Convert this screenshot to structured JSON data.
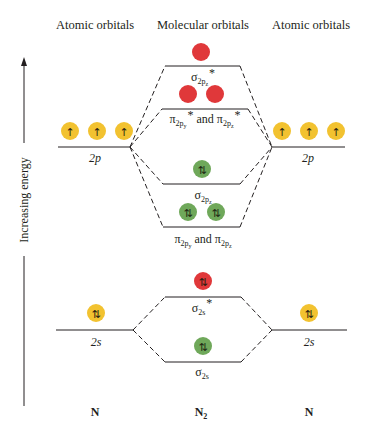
{
  "headers": {
    "left": "Atomic orbitals",
    "center": "Molecular orbitals",
    "right": "Atomic orbitals"
  },
  "axis": {
    "label": "Increasing energy",
    "direction": "up"
  },
  "colors": {
    "atomic_orbital": "#f2c230",
    "bonding": "#6fa85a",
    "antibonding": "#e0383a",
    "line": "#231f20"
  },
  "atoms": {
    "left": {
      "name": "N",
      "levels": [
        {
          "label": "2p",
          "electrons": [
            "↑",
            "↑",
            "↑"
          ]
        },
        {
          "label": "2s",
          "electrons": [
            "⇅"
          ]
        }
      ]
    },
    "right": {
      "name": "N",
      "levels": [
        {
          "label": "2p",
          "electrons": [
            "↑",
            "↑",
            "↑"
          ]
        },
        {
          "label": "2s",
          "electrons": [
            "⇅"
          ]
        }
      ]
    }
  },
  "molecule": {
    "name": "N",
    "name_subscript": "2",
    "orbitals": [
      {
        "id": "sigma2pz_star",
        "symbol": "σ",
        "sub": "2p",
        "subsub": "z",
        "star": "*",
        "type": "antibonding",
        "electrons": [
          ""
        ]
      },
      {
        "id": "pi2p_star",
        "text_a": "π",
        "sub_a": "2p",
        "subsub_a": "y",
        "star_a": "*",
        "conj": " and ",
        "text_b": "π",
        "sub_b": "2p",
        "subsub_b": "z",
        "star_b": "*",
        "type": "antibonding",
        "electrons": [
          "",
          ""
        ]
      },
      {
        "id": "sigma2pz",
        "symbol": "σ",
        "sub": "2p",
        "subsub": "z",
        "type": "bonding",
        "electrons": [
          "⇅"
        ]
      },
      {
        "id": "pi2p",
        "text_a": "π",
        "sub_a": "2p",
        "subsub_a": "y",
        "conj": " and ",
        "text_b": "π",
        "sub_b": "2p",
        "subsub_b": "z",
        "type": "bonding",
        "electrons": [
          "⇅",
          "⇅"
        ]
      },
      {
        "id": "sigma2s_star",
        "symbol": "σ",
        "sub": "2s",
        "star": "*",
        "type": "antibonding",
        "electrons": [
          "⇅"
        ]
      },
      {
        "id": "sigma2s",
        "symbol": "σ",
        "sub": "2s",
        "type": "bonding",
        "electrons": [
          "⇅"
        ]
      }
    ]
  }
}
